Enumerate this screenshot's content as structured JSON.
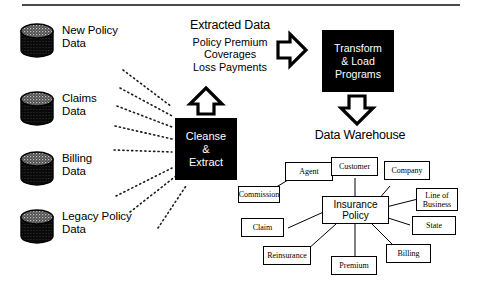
{
  "diagram": {
    "colors": {
      "ink": "#000000",
      "paper": "#ffffff",
      "rule": "#4a4a4a",
      "box_fill": "#000000",
      "box_text": "#ffffff"
    }
  },
  "sources": [
    {
      "label": "New Policy\nData",
      "icon": "database-cylinder-icon"
    },
    {
      "label": "Claims\nData",
      "icon": "database-cylinder-icon"
    },
    {
      "label": "Billing\nData",
      "icon": "database-cylinder-icon"
    },
    {
      "label": "Legacy Policy\nData",
      "icon": "database-cylinder-icon"
    }
  ],
  "extracted": {
    "title": "Extracted Data",
    "items": "Policy Premium\nCoverages\nLoss Payments"
  },
  "process": {
    "cleanse_label": "Cleanse\n&\nExtract",
    "transform_label": "Transform\n& Load\nPrograms",
    "up_arrow_icon": "arrow-up-icon",
    "right_arrow_icon": "arrow-right-icon",
    "down_arrow_icon": "arrow-down-icon"
  },
  "warehouse": {
    "caption": "Data Warehouse",
    "center_entity": "Insurance\nPolicy",
    "entities": [
      {
        "name": "Agent"
      },
      {
        "name": "Customer"
      },
      {
        "name": "Company"
      },
      {
        "name": "Commission"
      },
      {
        "name": "Line of\nBusiness"
      },
      {
        "name": "Claim"
      },
      {
        "name": "State"
      },
      {
        "name": "Reinsurance"
      },
      {
        "name": "Premium"
      },
      {
        "name": "Billing"
      }
    ]
  }
}
